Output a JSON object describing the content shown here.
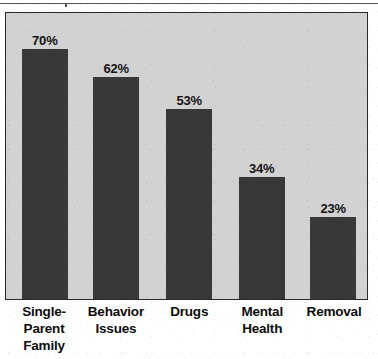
{
  "figure": {
    "background_color": "#d2d2d2",
    "bar_color": "#383838",
    "frame_color": "#2a2a2a",
    "text_color": "#0d0d0d"
  },
  "chart_data": {
    "type": "bar",
    "title": "",
    "subtitle": "",
    "xlabel": "",
    "ylabel": "",
    "ylim": [
      0,
      80
    ],
    "grid": false,
    "legend": false,
    "categories": [
      "Single-\nParent\nFamily",
      "Behavior\nIssues",
      "Drugs",
      "Mental\nHealth",
      "Removal"
    ],
    "values": [
      70,
      62,
      53,
      34,
      23
    ],
    "value_labels": [
      "70%",
      "62%",
      "53%",
      "34%",
      "23%"
    ],
    "bars": [
      {
        "category": "Single-\nParent\nFamily",
        "value": 70,
        "label": "70%",
        "left_pct": 4.4,
        "width_pct": 12.7,
        "height_pct": 87.5
      },
      {
        "category": "Behavior\nIssues",
        "value": 62,
        "label": "62%",
        "left_pct": 24.2,
        "width_pct": 12.7,
        "height_pct": 77.5
      },
      {
        "category": "Drugs",
        "value": 53,
        "label": "53%",
        "left_pct": 44.4,
        "width_pct": 12.7,
        "height_pct": 66.3
      },
      {
        "category": "Mental\nHealth",
        "value": 34,
        "label": "34%",
        "left_pct": 64.5,
        "width_pct": 12.7,
        "height_pct": 42.5
      },
      {
        "category": "Removal",
        "value": 23,
        "label": "23%",
        "left_pct": 84.3,
        "width_pct": 12.7,
        "height_pct": 28.8
      }
    ]
  }
}
